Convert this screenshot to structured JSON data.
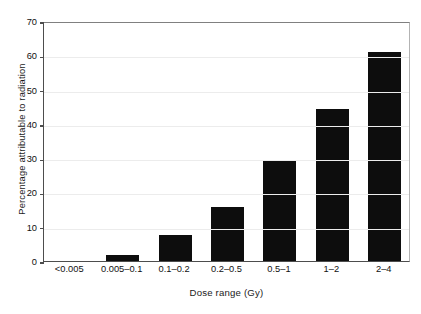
{
  "chart_data": {
    "type": "bar",
    "title": "",
    "subtitle": "",
    "xlabel": "Dose range (Gy)",
    "ylabel": "Percentage attributable to radiation",
    "categories": [
      "<0.005",
      "0.005–0.1",
      "0.1–0.2",
      "0.2–0.5",
      "0.5–1",
      "1–2",
      "2–4"
    ],
    "values": [
      0,
      1.7,
      7.5,
      15.7,
      29.5,
      44.2,
      61.0
    ],
    "ylim": [
      0,
      70
    ],
    "yticks": [
      0,
      10,
      20,
      30,
      40,
      50,
      60,
      70
    ],
    "ytick_labels": [
      "0",
      "10",
      "20",
      "30",
      "40",
      "50",
      "60",
      "70"
    ],
    "grid": "horizontal",
    "legend": "none",
    "bar_color": "#0d0d0d",
    "axis_color": "#4d4d4d",
    "grid_color": "#ececec",
    "background": "#ffffff"
  }
}
